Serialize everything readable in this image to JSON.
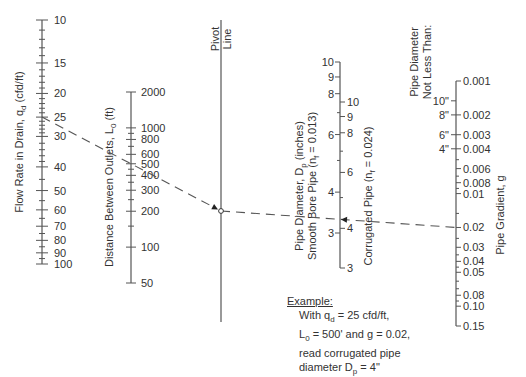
{
  "pivot": {
    "label_line1": "Pivot",
    "label_line2": "Line"
  },
  "axes": {
    "flow": {
      "title": "Flow Rate in Drain, q",
      "title_sub": "d",
      "title_unit": " (cfd/ft)",
      "labels": [
        "10",
        "15",
        "20",
        "25",
        "30",
        "40",
        "50",
        "60",
        "70",
        "80",
        "90",
        "100"
      ],
      "values": [
        10,
        15,
        20,
        25,
        30,
        40,
        50,
        60,
        70,
        80,
        90,
        100
      ]
    },
    "distance": {
      "title": "Distance Between Outlets, L",
      "title_sub": "0",
      "title_unit": " (ft)",
      "labels": [
        "2000",
        "1000",
        "800",
        "600",
        "500",
        "400",
        "300",
        "200",
        "100",
        "50"
      ],
      "values": [
        2000,
        1000,
        800,
        600,
        500,
        400,
        300,
        200,
        100,
        50
      ]
    },
    "smooth_pipe": {
      "title_line1": "Pipe Diameter, D",
      "title_line1_sub": "p",
      "title_line1_unit": " (inches)",
      "title_line2": "Smooth Bore Pipe (n",
      "title_line2_sub": "f",
      "title_line2_unit": " = 0.013)",
      "labels": [
        "10",
        "9",
        "8",
        "6",
        "4",
        "3"
      ],
      "values": [
        10,
        9,
        8,
        6,
        4,
        3
      ]
    },
    "corrugated_pipe": {
      "title": "Corrugated Pipe (n",
      "title_sub": "f",
      "title_unit": " = 0.024)",
      "labels": [
        "10",
        "9",
        "8",
        "6",
        "4",
        "3"
      ],
      "values": [
        10,
        9,
        8,
        6,
        4,
        3
      ]
    },
    "gradient": {
      "title": "Pipe Gradient, g",
      "labels": [
        "0.001",
        "0.002",
        "0.003",
        "0.004",
        "0.006",
        "0.008",
        "0.01",
        "0.02",
        "0.03",
        "0.04",
        "0.05",
        "0.08",
        "0.10",
        "0.15"
      ],
      "values": [
        0.001,
        0.002,
        0.003,
        0.004,
        0.006,
        0.008,
        0.01,
        0.02,
        0.03,
        0.04,
        0.05,
        0.08,
        0.1,
        0.15
      ]
    },
    "min_diameter": {
      "title_line1": "Pipe Diameter",
      "title_line2": "Not Less Than:",
      "labels": [
        "10\"",
        "8\"",
        "6\"",
        "4\""
      ],
      "gradient_equiv": [
        0.0015,
        0.002,
        0.003,
        0.004
      ]
    }
  },
  "example": {
    "heading": "Example:",
    "line1_a": "With q",
    "line1_sub": "d",
    "line1_b": " = 25 cfd/ft,",
    "line2_a": "L",
    "line2_sub": "0",
    "line2_b": " = 500' and g = 0.02,",
    "line3": "read corrugated pipe",
    "line4_a": "diameter D",
    "line4_sub": "p",
    "line4_b": " = 4\""
  },
  "solution": {
    "q_d": 25,
    "L_0": 500,
    "g": 0.02,
    "D_p_corrugated": 4
  }
}
